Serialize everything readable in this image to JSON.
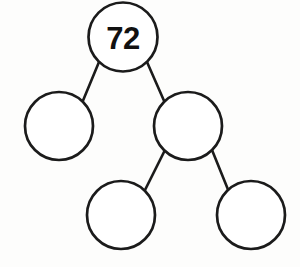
{
  "diagram": {
    "type": "factor-tree",
    "background_color": "#fdfdfc",
    "stroke_color": "#1b1b1b",
    "fill_color": "#ffffff",
    "text_color": "#111111",
    "nodes": [
      {
        "id": "root",
        "name": "root-node",
        "label": "72",
        "cx": 123,
        "cy": 37,
        "r": 34.5,
        "filled_value": true
      },
      {
        "id": "left",
        "name": "left-child-node",
        "label": "",
        "cx": 59,
        "cy": 126,
        "r": 34,
        "filled_value": false
      },
      {
        "id": "right",
        "name": "right-child-node",
        "label": "",
        "cx": 188,
        "cy": 126,
        "r": 34,
        "filled_value": false
      },
      {
        "id": "right-left",
        "name": "right-left-grandchild-node",
        "label": "",
        "cx": 121,
        "cy": 215,
        "r": 34,
        "filled_value": false
      },
      {
        "id": "right-right",
        "name": "right-right-grandchild-node",
        "label": "",
        "cx": 251,
        "cy": 215,
        "r": 34,
        "filled_value": false
      }
    ],
    "edges": [
      {
        "id": "root-left",
        "name": "edge-root-to-left",
        "x1": 99,
        "y1": 62,
        "x2": 82,
        "y2": 103
      },
      {
        "id": "root-right",
        "name": "edge-root-to-right",
        "x1": 147,
        "y1": 62,
        "x2": 165,
        "y2": 103
      },
      {
        "id": "right-leftchild",
        "name": "edge-right-to-left-child",
        "x1": 165,
        "y1": 150,
        "x2": 144,
        "y2": 192
      },
      {
        "id": "right-rightchild",
        "name": "edge-right-to-right-child",
        "x1": 212,
        "y1": 150,
        "x2": 229,
        "y2": 192
      }
    ]
  }
}
